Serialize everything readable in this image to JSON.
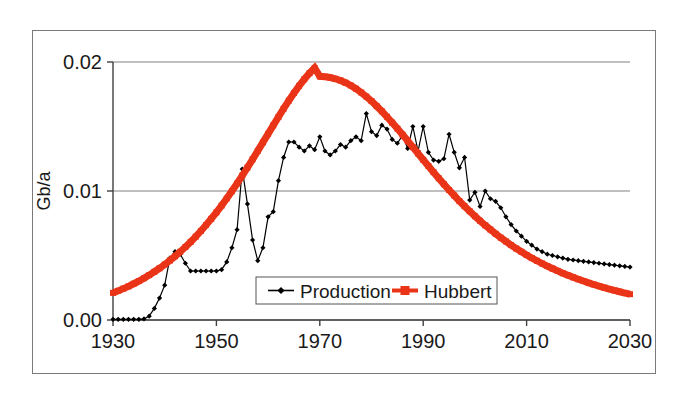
{
  "figure": {
    "kind": "line-chart-figure",
    "background_color": "#ffffff",
    "frame_color": "#7a7a7a"
  },
  "chart_data": {
    "type": "line",
    "title": "",
    "xlabel": "",
    "ylabel": "Gb/a",
    "xlim": [
      1930,
      2030
    ],
    "ylim": [
      0.0,
      0.02
    ],
    "xticks": [
      1930,
      1950,
      1970,
      1990,
      2010,
      2030
    ],
    "xtick_labels": [
      "1930",
      "1950",
      "1970",
      "1990",
      "2010",
      "2030"
    ],
    "yticks": [
      0.0,
      0.01,
      0.02
    ],
    "ytick_labels": [
      "0.00",
      "0.01",
      "0.02"
    ],
    "grid": "horizontal-only",
    "legend_position": "lower-center",
    "series": [
      {
        "name": "Production",
        "color": "#000000",
        "marker": "diamond",
        "linewidth": 1.2,
        "x": [
          1930,
          1931,
          1932,
          1933,
          1934,
          1935,
          1936,
          1937,
          1938,
          1939,
          1940,
          1941,
          1942,
          1943,
          1944,
          1945,
          1946,
          1947,
          1948,
          1949,
          1950,
          1951,
          1952,
          1953,
          1954,
          1955,
          1956,
          1957,
          1958,
          1959,
          1960,
          1961,
          1962,
          1963,
          1964,
          1965,
          1966,
          1967,
          1968,
          1969,
          1970,
          1971,
          1972,
          1973,
          1974,
          1975,
          1976,
          1977,
          1978,
          1979,
          1980,
          1981,
          1982,
          1983,
          1984,
          1985,
          1986,
          1987,
          1988,
          1989,
          1990,
          1991,
          1992,
          1993,
          1994,
          1995,
          1996,
          1997,
          1998,
          1999,
          2000,
          2001,
          2002,
          2003,
          2004,
          2005,
          2006,
          2007,
          2008,
          2009,
          2010,
          2011,
          2012,
          2013,
          2014,
          2015,
          2016,
          2017,
          2018,
          2019,
          2020,
          2021,
          2022,
          2023,
          2024,
          2025,
          2026,
          2027,
          2028,
          2029,
          2030
        ],
        "y": [
          5e-05,
          5e-05,
          5e-05,
          5e-05,
          5e-05,
          5e-05,
          8e-05,
          0.0003,
          0.0009,
          0.0017,
          0.0027,
          0.0048,
          0.0053,
          0.0051,
          0.0044,
          0.0038,
          0.0038,
          0.0038,
          0.0038,
          0.0038,
          0.0038,
          0.0039,
          0.0045,
          0.0056,
          0.007,
          0.0117,
          0.009,
          0.0062,
          0.0046,
          0.0056,
          0.008,
          0.0084,
          0.0108,
          0.0126,
          0.0138,
          0.0138,
          0.0134,
          0.0131,
          0.0135,
          0.0132,
          0.0142,
          0.0131,
          0.0128,
          0.0131,
          0.0136,
          0.0134,
          0.0139,
          0.0142,
          0.0139,
          0.016,
          0.0146,
          0.0143,
          0.0151,
          0.0148,
          0.014,
          0.0137,
          0.0143,
          0.0133,
          0.015,
          0.0131,
          0.015,
          0.013,
          0.0124,
          0.0123,
          0.0125,
          0.0144,
          0.013,
          0.0118,
          0.0126,
          0.0093,
          0.0099,
          0.0088,
          0.01,
          0.0094,
          0.0092,
          0.0087,
          0.008,
          0.0074,
          0.0069,
          0.0065,
          0.0061,
          0.0058,
          0.0055,
          0.0053,
          0.0051,
          0.005,
          0.0049,
          0.0048,
          0.0047,
          0.00465,
          0.0046,
          0.00455,
          0.0045,
          0.00445,
          0.0044,
          0.00435,
          0.0043,
          0.00425,
          0.0042,
          0.00415,
          0.0041
        ]
      },
      {
        "name": "Hubbert",
        "color": "#ea3418",
        "marker": "square",
        "linewidth": 7,
        "x": [
          1930,
          1931,
          1932,
          1933,
          1934,
          1935,
          1936,
          1937,
          1938,
          1939,
          1940,
          1941,
          1942,
          1943,
          1944,
          1945,
          1946,
          1947,
          1948,
          1949,
          1950,
          1951,
          1952,
          1953,
          1954,
          1955,
          1956,
          1957,
          1958,
          1959,
          1960,
          1961,
          1962,
          1963,
          1964,
          1965,
          1966,
          1967,
          1968,
          1969,
          1970,
          1971,
          1972,
          1973,
          1974,
          1975,
          1976,
          1977,
          1978,
          1979,
          1980,
          1981,
          1982,
          1983,
          1984,
          1985,
          1986,
          1987,
          1988,
          1989,
          1990,
          1991,
          1992,
          1993,
          1994,
          1995,
          1996,
          1997,
          1998,
          1999,
          2000,
          2001,
          2002,
          2003,
          2004,
          2005,
          2006,
          2007,
          2008,
          2009,
          2010,
          2011,
          2012,
          2013,
          2014,
          2015,
          2016,
          2017,
          2018,
          2019,
          2020,
          2021,
          2022,
          2023,
          2024,
          2025,
          2026,
          2027,
          2028,
          2029,
          2030
        ],
        "y": [
          0.0021,
          0.00226,
          0.00243,
          0.00261,
          0.00281,
          0.00302,
          0.00324,
          0.00348,
          0.00374,
          0.00401,
          0.0043,
          0.00461,
          0.00494,
          0.00529,
          0.00566,
          0.00605,
          0.00646,
          0.0069,
          0.00736,
          0.00784,
          0.00834,
          0.00887,
          0.00942,
          0.00999,
          0.01058,
          0.01119,
          0.01182,
          0.01246,
          0.01311,
          0.01377,
          0.01443,
          0.01509,
          0.01574,
          0.01638,
          0.017,
          0.01759,
          0.01815,
          0.01866,
          0.01913,
          0.01954,
          0.01889,
          0.01886,
          0.0188,
          0.0187,
          0.01857,
          0.01839,
          0.01818,
          0.01793,
          0.01764,
          0.01732,
          0.01697,
          0.01658,
          0.01618,
          0.01575,
          0.0153,
          0.01484,
          0.01437,
          0.01389,
          0.0134,
          0.01291,
          0.01242,
          0.01194,
          0.01146,
          0.01099,
          0.01053,
          0.01008,
          0.00965,
          0.00922,
          0.00882,
          0.00843,
          0.00805,
          0.00769,
          0.00734,
          0.00701,
          0.00669,
          0.00638,
          0.00609,
          0.00581,
          0.00554,
          0.00529,
          0.00504,
          0.00481,
          0.00459,
          0.00438,
          0.00418,
          0.00399,
          0.00381,
          0.00363,
          0.00347,
          0.00331,
          0.00316,
          0.00302,
          0.00288,
          0.00275,
          0.00263,
          0.00251,
          0.0024,
          0.00229,
          0.00219,
          0.00209,
          0.002
        ]
      }
    ],
    "annotations": []
  },
  "legend": {
    "entries": [
      {
        "label": "Production",
        "marker": "diamond",
        "color": "#000000"
      },
      {
        "label": "Hubbert",
        "marker": "square",
        "color": "#ea3418"
      }
    ]
  }
}
